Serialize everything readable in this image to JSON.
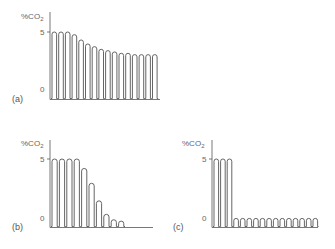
{
  "chart_data": [
    {
      "type": "line",
      "panel_label": "(a)",
      "ylabel": "%CO2",
      "yticks": [
        "5",
        "0"
      ],
      "ylim": [
        0,
        5.6
      ],
      "description": "Capnogram waveform, gradual decline in end-tidal CO2 plateau",
      "breaths": 16,
      "peak_values": [
        5,
        5,
        5,
        4.8,
        4.4,
        4.1,
        3.9,
        3.7,
        3.6,
        3.5,
        3.4,
        3.4,
        3.3,
        3.3,
        3.3,
        3.3
      ]
    },
    {
      "type": "line",
      "panel_label": "(b)",
      "ylabel": "%CO2",
      "yticks": [
        "5",
        "0"
      ],
      "ylim": [
        0,
        5.6
      ],
      "description": "Capnogram waveform, rapid exponential decline to near zero",
      "breaths": 10,
      "peak_values": [
        5,
        5,
        5,
        5,
        4.3,
        3.2,
        1.9,
        0.9,
        0.5,
        0.4
      ]
    },
    {
      "type": "line",
      "panel_label": "(c)",
      "ylabel": "%CO2",
      "yticks": [
        "5",
        "0"
      ],
      "ylim": [
        0,
        5.6
      ],
      "description": "Capnogram waveform, sudden drop to low-level oscillation",
      "breaths": 16,
      "peak_values": [
        5,
        5,
        5,
        0.6,
        0.6,
        0.6,
        0.6,
        0.6,
        0.6,
        0.6,
        0.6,
        0.6,
        0.6,
        0.6,
        0.6,
        0.6
      ]
    }
  ],
  "panels": [
    {
      "id": "a",
      "label": "(a)",
      "ylabel": "%CO",
      "ylabel_sub": "2",
      "tick5": "5",
      "tick0": "0"
    },
    {
      "id": "b",
      "label": "(b)",
      "ylabel": "%CO",
      "ylabel_sub": "2",
      "tick5": "5",
      "tick0": "0"
    },
    {
      "id": "c",
      "label": "(c)",
      "ylabel": "%CO",
      "ylabel_sub": "2",
      "tick5": "5",
      "tick0": "0"
    }
  ],
  "colors": {
    "line": "#555555",
    "axis": "#555555",
    "text": "#666666"
  }
}
